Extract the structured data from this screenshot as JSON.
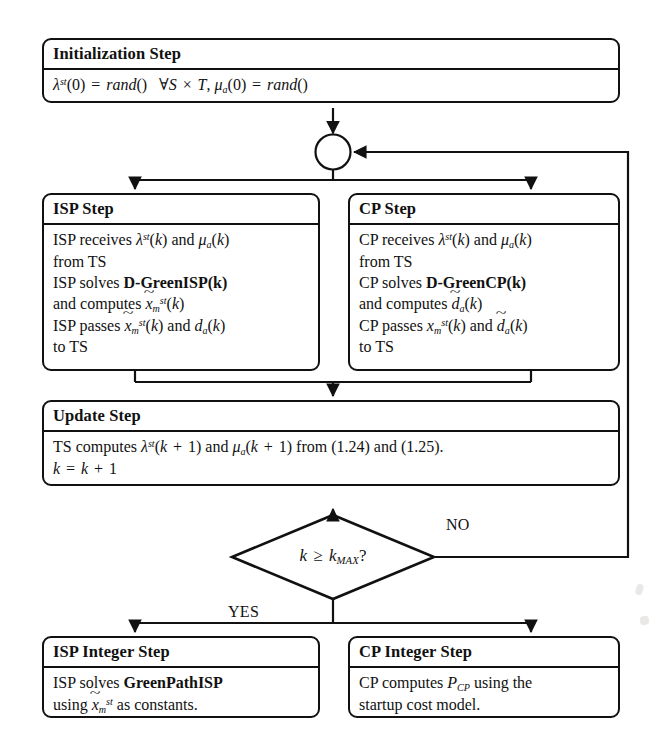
{
  "diagram": {
    "stroke_color": "#111111",
    "background_color": "#ffffff",
    "nodes": {
      "initialization": {
        "header": "Initialization Step",
        "body_lines": [
          "λ^{st}(0) = rand()   ∀S × T, μ_a(0) = rand()"
        ]
      },
      "isp_step": {
        "header": "ISP Step",
        "body_lines": [
          "ISP receives λ^{st}(k) and μ_a(k)",
          "from TS",
          "ISP solves D-GreenISP(k)",
          "and computes x̃_m^{st}(k)",
          "ISP passes x̃_m^{st}(k) and d_a(k)",
          "to TS"
        ]
      },
      "cp_step": {
        "header": "CP Step",
        "body_lines": [
          "CP receives λ^{st}(k) and μ_a(k)",
          "from TS",
          "CP solves D-GreenCP(k)",
          "and computes d̃_a(k)",
          "CP passes x_m^{st}(k) and d̃_a(k)",
          "to TS"
        ]
      },
      "update_step": {
        "header": "Update Step",
        "body_lines": [
          "TS computes λ^{st}(k + 1) and μ_a(k + 1) from (1.24) and (1.25).",
          "k = k + 1"
        ]
      },
      "decision": {
        "text": "k ≥ k_{MAX}?"
      },
      "isp_integer_step": {
        "header": "ISP Integer Step",
        "body_lines": [
          "ISP solves GreenPathISP",
          "using x̃_m^{st} as constants."
        ]
      },
      "cp_integer_step": {
        "header": "CP Integer Step",
        "body_lines": [
          "CP computes P_{CP} using the",
          "startup cost model."
        ]
      }
    },
    "edge_labels": {
      "no": "NO",
      "yes": "YES"
    },
    "equation_refs": [
      "(1.24)",
      "(1.25)"
    ]
  }
}
